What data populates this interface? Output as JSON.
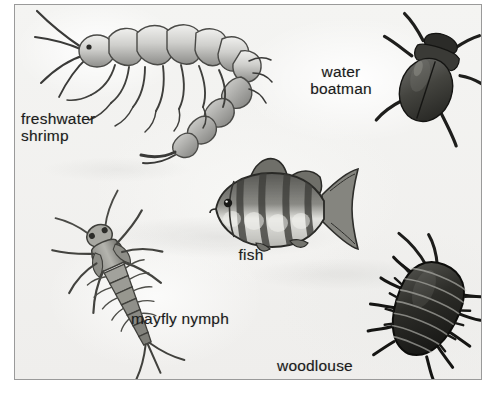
{
  "figure": {
    "style": "grayscale pencil / scanned textbook artwork",
    "border_color": "#9a9a9a",
    "background_color": "#f3f3f1",
    "ink_color": "#1c1c1c"
  },
  "labels": {
    "freshwater_shrimp": "freshwater\nshrimp",
    "water_boatman": "water\nboatman",
    "fish": "fish",
    "mayfly_nymph": "mayfly nymph",
    "woodlouse": "woodlouse"
  },
  "organisms": [
    {
      "id": "freshwater-shrimp",
      "label": "freshwater shrimp",
      "label_lines": [
        "freshwater",
        "shrimp"
      ],
      "position": "top-left",
      "description": "large segmented amphipod with long antennae, many legs and a curved tail, drawn in pencil shading",
      "shade": "light-gray"
    },
    {
      "id": "water-boatman",
      "label": "water boatman",
      "label_lines": [
        "water",
        "boatman"
      ],
      "position": "top-right",
      "description": "dark oval-bodied beetle tilted diagonally with six legs",
      "shade": "dark-gray"
    },
    {
      "id": "fish",
      "label": "fish",
      "label_lines": [
        "fish"
      ],
      "position": "center",
      "description": "perch-like fish with spiny dorsal fin, forked tail and vertical dark bands",
      "shade": "medium-gray"
    },
    {
      "id": "mayfly-nymph",
      "label": "mayfly nymph",
      "label_lines": [
        "mayfly nymph"
      ],
      "position": "bottom-left",
      "description": "slender nymph with head, antennae, six legs, segmented abdomen and three tail filaments",
      "shade": "medium-gray"
    },
    {
      "id": "woodlouse",
      "label": "woodlouse",
      "label_lines": [
        "woodlouse"
      ],
      "position": "bottom-right",
      "description": "dark oval isopod with overlapping segmented plates, spiny legs and two antennae",
      "shade": "very-dark"
    }
  ]
}
